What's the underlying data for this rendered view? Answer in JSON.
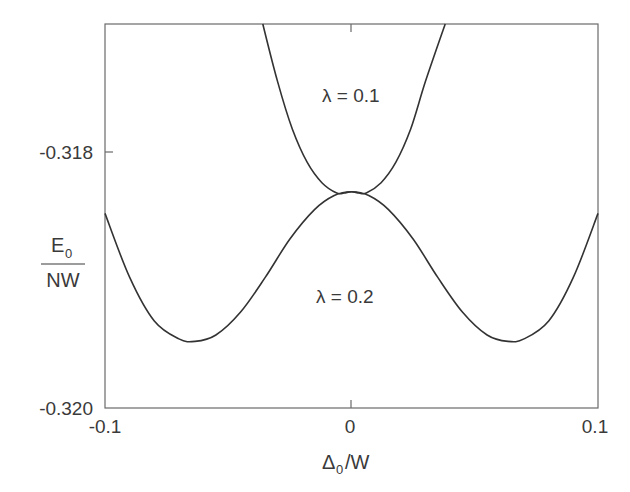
{
  "chart_data": {
    "type": "line",
    "title": "",
    "xlabel": "Δ₀/W",
    "xlabel_main": "Δ",
    "xlabel_sub": "0",
    "xlabel_tail": "/W",
    "ylabel_numerator": "E",
    "ylabel_numerator_sub": "0",
    "ylabel_denominator": "NW",
    "xlim": [
      -0.1,
      0.1
    ],
    "ylim": [
      -0.32,
      -0.317
    ],
    "grid": false,
    "legend": "none (inline curve labels)",
    "x_ticks": [
      {
        "value": -0.1,
        "label": "-0.1"
      },
      {
        "value": 0,
        "label": "0"
      },
      {
        "value": 0.1,
        "label": "0.1"
      }
    ],
    "y_ticks": [
      {
        "value": -0.318,
        "label": "-0.318"
      },
      {
        "value": -0.32,
        "label": "-0.320"
      }
    ],
    "annotations": [
      {
        "text": "λ = 0.1",
        "x": 0.0,
        "y": -0.3175
      },
      {
        "text": "λ = 0.2",
        "x": 0.0,
        "y": -0.3192
      }
    ],
    "series": [
      {
        "name": "λ = 0.1",
        "x": [
          -0.036,
          -0.03,
          -0.024,
          -0.018,
          -0.012,
          -0.006,
          -0.003,
          0.0,
          0.003,
          0.006,
          0.012,
          0.018,
          0.024,
          0.03,
          0.038
        ],
        "y": [
          -0.317,
          -0.31745,
          -0.31782,
          -0.31808,
          -0.31824,
          -0.31832,
          -0.31832,
          -0.31831,
          -0.31832,
          -0.31832,
          -0.31824,
          -0.31808,
          -0.31782,
          -0.31745,
          -0.317
        ]
      },
      {
        "name": "λ = 0.2",
        "x": [
          -0.1,
          -0.09,
          -0.08,
          -0.07,
          -0.0635,
          -0.055,
          -0.045,
          -0.035,
          -0.025,
          -0.015,
          -0.007,
          0.0,
          0.007,
          0.015,
          0.025,
          0.035,
          0.045,
          0.055,
          0.0635,
          0.07,
          0.08,
          0.09,
          0.1
        ],
        "y": [
          -0.31848,
          -0.31898,
          -0.31932,
          -0.31946,
          -0.31948,
          -0.31943,
          -0.31925,
          -0.31898,
          -0.31868,
          -0.31845,
          -0.31834,
          -0.31831,
          -0.31834,
          -0.31845,
          -0.31868,
          -0.31898,
          -0.31925,
          -0.31943,
          -0.31948,
          -0.31946,
          -0.31932,
          -0.31898,
          -0.31848
        ]
      }
    ]
  },
  "labels": {
    "ytick_318": "-0.318",
    "ytick_320": "-0.320",
    "xtick_neg": "-0.1",
    "xtick_zero": "0",
    "xtick_pos": "0.1",
    "ylabel_num": "E",
    "ylabel_num_sub": "0",
    "ylabel_den": "NW",
    "xlabel_delta": "Δ",
    "xlabel_sub": "0",
    "xlabel_tail": "/W",
    "curve1": "λ = 0.1",
    "curve2": "λ = 0.2"
  }
}
